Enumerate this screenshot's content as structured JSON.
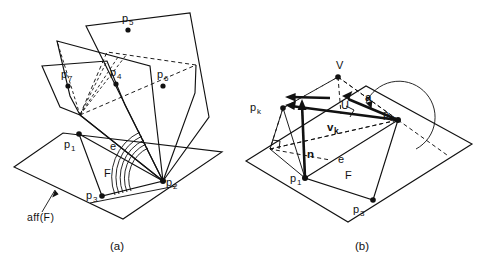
{
  "figure": {
    "title": "",
    "background_color": "#ffffff",
    "ink_color": "#111111",
    "width": 482,
    "height": 260
  },
  "panels": [
    {
      "id": "a",
      "caption": "(a)",
      "caption_pos": {
        "x": 113,
        "y": 248
      },
      "description": "Wedge of half-planes hinged on edge through p1 and p2 above the affine hull plane aff(F)",
      "labels": [
        {
          "name": "point-p5",
          "base": "p",
          "sub": "5",
          "x": 124,
          "y": 21
        },
        {
          "name": "point-p7",
          "base": "p",
          "sub": "7",
          "x": 63,
          "y": 76
        },
        {
          "name": "point-p4",
          "base": "p",
          "sub": "4",
          "x": 113,
          "y": 74
        },
        {
          "name": "point-p6",
          "base": "p",
          "sub": "6",
          "x": 160,
          "y": 76
        },
        {
          "name": "point-p1",
          "base": "p",
          "sub": "1",
          "x": 66,
          "y": 146
        },
        {
          "name": "point-p2",
          "base": "p",
          "sub": "2",
          "x": 167,
          "y": 184
        },
        {
          "name": "point-p3",
          "base": "p",
          "sub": "3",
          "x": 88,
          "y": 200
        },
        {
          "name": "edge-e",
          "base": "e",
          "sub": "",
          "x": 112,
          "y": 147
        },
        {
          "name": "facet-F",
          "base": "F",
          "sub": "",
          "x": 106,
          "y": 175
        },
        {
          "name": "aff-F",
          "base": "aff(F)",
          "sub": "",
          "x": 30,
          "y": 215
        }
      ]
    },
    {
      "id": "b",
      "caption": "(b)",
      "caption_pos": {
        "x": 358,
        "y": 248
      },
      "description": "Normal vector n at p1, vectors v_k, u and V over plane F with dihedral angle a at p2",
      "labels": [
        {
          "name": "point-pk",
          "base": "p",
          "sub": "k",
          "x": 252,
          "y": 110
        },
        {
          "name": "vector-V",
          "base": "V",
          "sub": "",
          "x": 339,
          "y": 65
        },
        {
          "name": "vector-U",
          "base": "U",
          "sub": "",
          "x": 344,
          "y": 105
        },
        {
          "name": "angle-a",
          "base": "a",
          "sub": "",
          "x": 369,
          "y": 99
        },
        {
          "name": "vector-vk",
          "base": "v",
          "sub": "k",
          "x": 330,
          "y": 128
        },
        {
          "name": "point-p2",
          "base": "p",
          "sub": "2",
          "x": 385,
          "y": 122
        },
        {
          "name": "vector-n",
          "base": "n",
          "sub": "",
          "x": 310,
          "y": 155
        },
        {
          "name": "edge-e",
          "base": "e",
          "sub": "",
          "x": 340,
          "y": 160
        },
        {
          "name": "facet-F",
          "base": "F",
          "sub": "",
          "x": 348,
          "y": 176
        },
        {
          "name": "point-p1",
          "base": "p",
          "sub": "1",
          "x": 292,
          "y": 180
        },
        {
          "name": "point-p3",
          "base": "p",
          "sub": "3",
          "x": 355,
          "y": 211
        }
      ]
    }
  ],
  "caption_a": "(a)",
  "caption_b": "(b)",
  "text": {
    "aff_f": "aff(F)",
    "e": "e",
    "F": "F",
    "p": "p",
    "v": "v",
    "n": "n",
    "U": "U",
    "V": "V",
    "a": "a",
    "sub_1": "1",
    "sub_2": "2",
    "sub_3": "3",
    "sub_4": "4",
    "sub_5": "5",
    "sub_6": "6",
    "sub_7": "7",
    "sub_k": "k"
  }
}
